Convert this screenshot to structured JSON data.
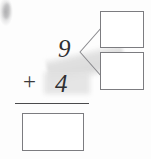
{
  "worksheet": {
    "title": "Make-ten addition problem with number bond",
    "problem_type": "vertical-addition-with-decomposition"
  },
  "problem": {
    "addend_top": "9",
    "operator": "+",
    "addend_bottom": "4",
    "sum": "",
    "sum_placeholder": ""
  },
  "decomposition": {
    "source_number": "9",
    "part_a": "",
    "part_b": "",
    "bracket_icon": "branch-bracket-icon"
  },
  "marks": {
    "smudge_icon": "scan-smudge-icon",
    "shadow_icon": "scan-shadow-icon",
    "rule_icon": "horizontal-rule-icon"
  },
  "colors": {
    "ink": "#2f2f31",
    "box_border": "#7c7c80",
    "rule": "#4a4a4c",
    "bracket": "#8a8a8e",
    "paper": "#fdfdfd",
    "shadow": "#e2e2e2"
  }
}
